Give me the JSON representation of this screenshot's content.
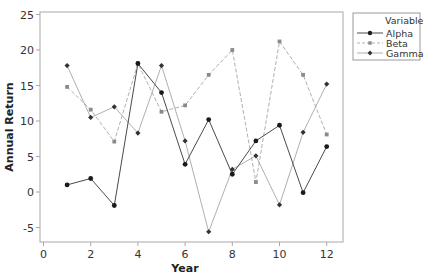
{
  "chart_data": {
    "type": "line",
    "title": "",
    "xlabel": "Year",
    "ylabel": "Annual Return",
    "x": [
      1,
      2,
      3,
      4,
      5,
      6,
      7,
      8,
      9,
      10,
      11,
      12
    ],
    "xlim": [
      -0.2,
      12.7
    ],
    "ylim": [
      -6.9,
      25.4
    ],
    "xticks": [
      0,
      2,
      4,
      6,
      8,
      10,
      12
    ],
    "yticks": [
      -5,
      0,
      5,
      10,
      15,
      20,
      25
    ],
    "xtick_labels": [
      "0",
      "2",
      "4",
      "6",
      "8",
      "10",
      "12"
    ],
    "ytick_labels": [
      "-5",
      "0",
      "5",
      "10",
      "15",
      "20",
      "25"
    ],
    "grid": false,
    "legend": {
      "title": "Variable",
      "position": "right-top",
      "entries": [
        "Alpha",
        "Beta",
        "Gamma"
      ]
    },
    "series": [
      {
        "name": "Alpha",
        "values": [
          1.0,
          1.9,
          -1.9,
          18.1,
          14.0,
          3.9,
          10.2,
          2.5,
          7.2,
          9.4,
          -0.1,
          6.4
        ],
        "color": "#4a4a4a",
        "line_style": "solid",
        "marker": "circle",
        "marker_color": "#1a1a1a"
      },
      {
        "name": "Beta",
        "values": [
          14.8,
          11.6,
          7.1,
          18.1,
          11.3,
          12.2,
          16.5,
          20.0,
          1.4,
          21.2,
          16.5,
          8.1
        ],
        "color": "#b0b0b0",
        "line_style": "dashed",
        "marker": "square",
        "marker_color": "#8a8a8a"
      },
      {
        "name": "Gamma",
        "values": [
          17.8,
          10.5,
          12.0,
          8.3,
          17.8,
          7.2,
          -5.6,
          3.2,
          5.1,
          -1.8,
          8.4,
          15.2
        ],
        "color": "#9a9a9a",
        "line_style": "solid-thin",
        "marker": "diamond",
        "marker_color": "#333333"
      }
    ]
  },
  "axes": {
    "x_title": "Year",
    "y_title": "Annual Return"
  },
  "legend": {
    "title": "Variable",
    "items": [
      {
        "label": "Alpha"
      },
      {
        "label": "Beta"
      },
      {
        "label": "Gamma"
      }
    ]
  }
}
